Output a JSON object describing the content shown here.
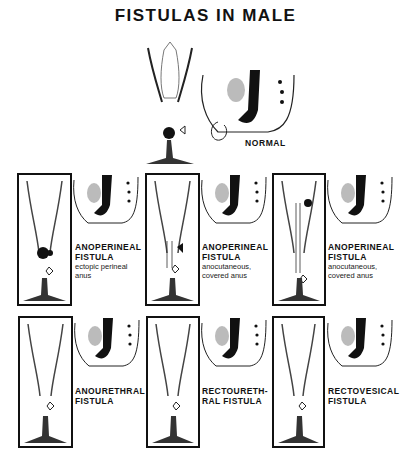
{
  "title": "FISTULAS IN MALE",
  "normal": {
    "label": "NORMAL"
  },
  "panels": [
    {
      "main": "ANOPERINEAL\nFISTULA",
      "sub": "ectopic perineal\nanus"
    },
    {
      "main": "ANOPERINEAL\nFISTULA",
      "sub": "anocutaneous,\ncovered anus"
    },
    {
      "main": "ANOPERINEAL\nFISTULA",
      "sub": "anocutaneous,\ncovered anus"
    },
    {
      "main": "ANOURETHRAL\nFISTULA",
      "sub": ""
    },
    {
      "main": "RECTOURETH-\nRAL FISTULA",
      "sub": ""
    },
    {
      "main": "RECTOVESICAL\nFISTULA",
      "sub": ""
    }
  ],
  "icons": [
    "perineum-view-icon",
    "sagittal-pelvis-icon",
    "arrow-icon"
  ]
}
